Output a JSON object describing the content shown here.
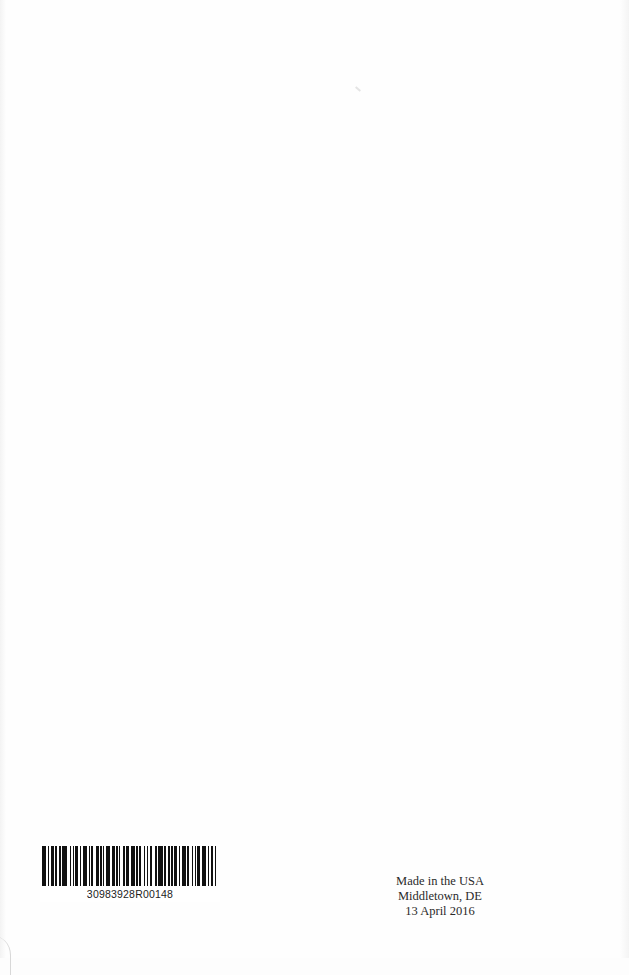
{
  "page": {
    "type": "book back page (printer colophon)",
    "background_color": "#fdfdfd"
  },
  "barcode": {
    "number": "30983928R00148",
    "bar_pattern": [
      3,
      1,
      1,
      1,
      2,
      1,
      1,
      2,
      1,
      1,
      3,
      2,
      1,
      1,
      1,
      1,
      2,
      1,
      1,
      1,
      3,
      1,
      1,
      1,
      1,
      2,
      2,
      1,
      1,
      1,
      1,
      1,
      3,
      1,
      2,
      1,
      1,
      1,
      1,
      2,
      1,
      1,
      2,
      1,
      3,
      1,
      1,
      1,
      1,
      2,
      1,
      1,
      1,
      1,
      2,
      2,
      1,
      1,
      3,
      1,
      1,
      2,
      1,
      1,
      1,
      1,
      2,
      1,
      1,
      1,
      3,
      1,
      1,
      2,
      1,
      1,
      1,
      1,
      2,
      1,
      3,
      1,
      1,
      1,
      2,
      1,
      1,
      1
    ]
  },
  "colophon": {
    "line1": "Made in the USA",
    "line2": "Middletown, DE",
    "line3": "13 April 2016"
  }
}
